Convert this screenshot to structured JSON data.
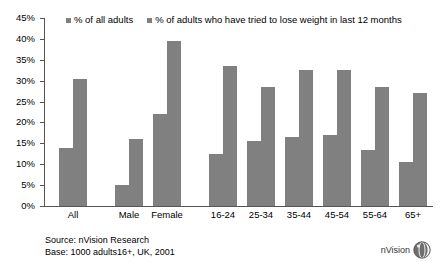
{
  "chart_data": {
    "type": "bar",
    "title": "",
    "subtitle": "",
    "xlabel": "",
    "ylabel": "",
    "ylim": [
      0,
      45
    ],
    "ytick_step": 5,
    "ytick_labels": [
      "0%",
      "5%",
      "10%",
      "15%",
      "20%",
      "25%",
      "30%",
      "35%",
      "40%",
      "45%"
    ],
    "ytick_values": [
      0,
      5,
      10,
      15,
      20,
      25,
      30,
      35,
      40,
      45
    ],
    "grid": false,
    "legend_position": "top",
    "bar_color": "#808080",
    "axis_color": "#555555",
    "categories": [
      "All",
      "Male",
      "Female",
      "16-24",
      "25-34",
      "35-44",
      "45-54",
      "55-64",
      "65+"
    ],
    "group_breaks_after": [
      "All",
      "Female"
    ],
    "series": [
      {
        "name": "% of all adults",
        "values": [
          14,
          5,
          22,
          12.5,
          15.5,
          16.5,
          17,
          13.5,
          10.5
        ]
      },
      {
        "name": "% of adults who have tried to lose weight in last 12 months",
        "values": [
          30.5,
          16,
          39.5,
          33.5,
          28.5,
          32.5,
          32.5,
          28.5,
          27
        ]
      }
    ],
    "annotations": [
      "Source: nVision Research",
      "Base: 1000 adults16+, UK, 2001"
    ]
  },
  "legend": {
    "entries": [
      {
        "label": "% of all adults",
        "color": "#808080"
      },
      {
        "label": "% of adults who have tried to lose weight in last 12 months",
        "color": "#808080"
      }
    ]
  },
  "footer": {
    "source_line": "Source: nVision Research",
    "base_line": "Base: 1000 adults16+, UK, 2001"
  },
  "logo": {
    "text": "nVision",
    "icon": "sphere-icon"
  }
}
